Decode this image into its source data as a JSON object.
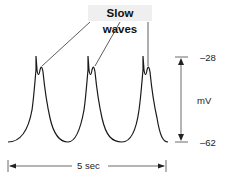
{
  "figure": {
    "title": "Slow waves",
    "voltage_scale": {
      "top_label": "–28",
      "unit_label": "mV",
      "bottom_label": "–62"
    },
    "time_scale": {
      "label": "5 sec"
    },
    "spike_count": 3,
    "colors": {
      "trace": "#1a1a1a",
      "label_bg": "#efefef",
      "scale": "#555555"
    }
  }
}
